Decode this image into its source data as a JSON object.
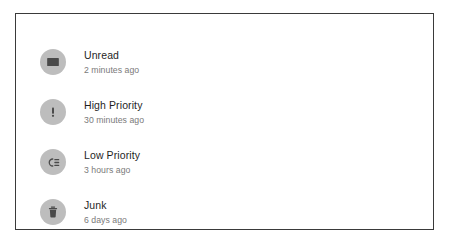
{
  "card": {
    "border_color": "#3a3a3a",
    "background": "#ffffff"
  },
  "theme": {
    "icon_circle_color": "#bdbdbd",
    "icon_glyph_color": "#4a4a4a",
    "title_color": "#1f1f1f",
    "timestamp_color": "#7a7a7a"
  },
  "list": {
    "items": [
      {
        "icon": "envelope-icon",
        "title": "Unread",
        "timestamp": "2 minutes ago"
      },
      {
        "icon": "exclamation-icon",
        "title": "High Priority",
        "timestamp": "30 minutes ago"
      },
      {
        "icon": "low-priority-icon",
        "title": "Low Priority",
        "timestamp": "3 hours ago"
      },
      {
        "icon": "trash-icon",
        "title": "Junk",
        "timestamp": "6 days ago"
      }
    ]
  }
}
